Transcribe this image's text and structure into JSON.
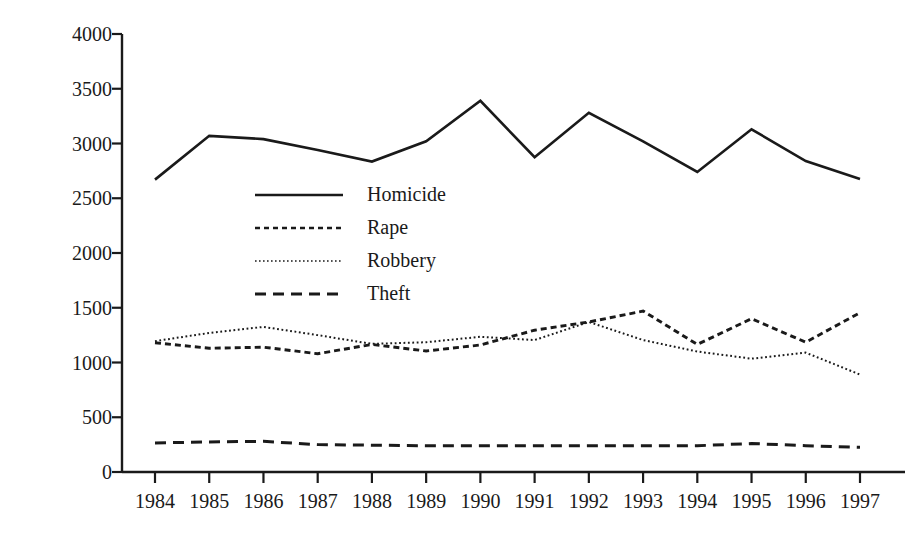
{
  "chart_data": {
    "type": "line",
    "title": "",
    "xlabel": "",
    "ylabel": "Sentence length (in days)",
    "categories": [
      "1984",
      "1985",
      "1986",
      "1987",
      "1988",
      "1989",
      "1990",
      "1991",
      "1992",
      "1993",
      "1994",
      "1995",
      "1996",
      "1997"
    ],
    "x": [
      1984,
      1985,
      1986,
      1987,
      1988,
      1989,
      1990,
      1991,
      1992,
      1993,
      1994,
      1995,
      1996,
      1997
    ],
    "ylim": [
      0,
      4000
    ],
    "xlim": [
      1984,
      1997
    ],
    "yticks": [
      0,
      500,
      1000,
      1500,
      2000,
      2500,
      3000,
      3500,
      4000
    ],
    "ytick_labels": [
      "0",
      "500",
      "1000",
      "1500",
      "2000",
      "2500",
      "3000",
      "3500",
      "4000"
    ],
    "grid": false,
    "legend_position": "inside-upper-left",
    "series": [
      {
        "name": "Homicide",
        "style": "solid",
        "color": "#1a1a1a",
        "values": [
          2670,
          3070,
          3040,
          2940,
          2835,
          3020,
          3390,
          2875,
          3280,
          3020,
          2740,
          3130,
          2840,
          2675
        ]
      },
      {
        "name": "Rape",
        "style": "dashed-small",
        "color": "#1a1a1a",
        "values": [
          1180,
          1130,
          1140,
          1080,
          1165,
          1105,
          1160,
          1295,
          1370,
          1470,
          1165,
          1400,
          1185,
          1455
        ]
      },
      {
        "name": "Robbery",
        "style": "dotted",
        "color": "#1a1a1a",
        "values": [
          1195,
          1270,
          1325,
          1250,
          1170,
          1185,
          1235,
          1205,
          1370,
          1205,
          1100,
          1035,
          1090,
          890
        ]
      },
      {
        "name": "Theft",
        "style": "dashed-long",
        "color": "#1a1a1a",
        "values": [
          265,
          275,
          280,
          250,
          245,
          240,
          240,
          240,
          240,
          240,
          240,
          260,
          240,
          225
        ]
      }
    ]
  },
  "axes": {
    "y_title": "Sentence length (in days)"
  },
  "legend": {
    "entries": [
      {
        "label": "Homicide",
        "style": "solid"
      },
      {
        "label": "Rape",
        "style": "dashed-small"
      },
      {
        "label": "Robbery",
        "style": "dotted"
      },
      {
        "label": "Theft",
        "style": "dashed-long"
      }
    ]
  },
  "colors": {
    "ink": "#1a1a1a",
    "background": "#ffffff"
  }
}
